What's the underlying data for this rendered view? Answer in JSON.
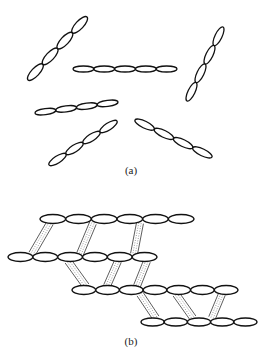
{
  "figure": {
    "stroke_color": "#111111",
    "rung_color": "#555555",
    "panel_a": {
      "label": "(a)",
      "label_pos": [
        131,
        165
      ],
      "chains": [
        {
          "name": "chain-upper-left-diagonal",
          "start": [
            28,
            80
          ],
          "end": [
            87,
            17
          ],
          "count": 4,
          "width": 8
        },
        {
          "name": "chain-middle-horizontal",
          "start": [
            73,
            69
          ],
          "end": [
            177,
            69
          ],
          "count": 5,
          "width": 6
        },
        {
          "name": "chain-right-steep",
          "start": [
            187,
            101
          ],
          "end": [
            223,
            27
          ],
          "count": 4,
          "width": 7
        },
        {
          "name": "chain-lower-left-horizontal",
          "start": [
            35,
            113
          ],
          "end": [
            118,
            102
          ],
          "count": 4,
          "width": 6
        },
        {
          "name": "chain-lower-left-diagonal",
          "start": [
            49,
            165
          ],
          "end": [
            117,
            121
          ],
          "count": 4,
          "width": 7
        },
        {
          "name": "chain-lower-right-diagonal",
          "start": [
            135,
            120
          ],
          "end": [
            212,
            157
          ],
          "count": 4,
          "width": 7
        }
      ]
    },
    "panel_b": {
      "label": "(b)",
      "label_pos": [
        131,
        336
      ],
      "rows": [
        {
          "name": "row-1",
          "x_start": 40,
          "x_end": 194,
          "y": 219,
          "count": 6,
          "height": 9
        },
        {
          "name": "row-2",
          "x_start": 8,
          "x_end": 157,
          "y": 257,
          "count": 6,
          "height": 9
        },
        {
          "name": "row-3",
          "x_start": 72,
          "x_end": 238,
          "y": 290,
          "count": 7,
          "height": 9
        },
        {
          "name": "row-4",
          "x_start": 141,
          "x_end": 257,
          "y": 322,
          "count": 5,
          "height": 8
        }
      ],
      "rungs": [
        {
          "from": [
            50,
            223
          ],
          "to": [
            32,
            254
          ],
          "w": 7
        },
        {
          "from": [
            93,
            223
          ],
          "to": [
            80,
            254
          ],
          "w": 7
        },
        {
          "from": [
            140,
            223
          ],
          "to": [
            134,
            254
          ],
          "w": 7
        },
        {
          "from": [
            68,
            261
          ],
          "to": [
            86,
            286
          ],
          "w": 7
        },
        {
          "from": [
            118,
            261
          ],
          "to": [
            107,
            286
          ],
          "w": 7
        },
        {
          "from": [
            147,
            261
          ],
          "to": [
            137,
            286
          ],
          "w": 7
        },
        {
          "from": [
            140,
            294
          ],
          "to": [
            156,
            318
          ],
          "w": 7
        },
        {
          "from": [
            176,
            294
          ],
          "to": [
            193,
            318
          ],
          "w": 7
        },
        {
          "from": [
            222,
            294
          ],
          "to": [
            212,
            318
          ],
          "w": 7
        }
      ]
    }
  }
}
